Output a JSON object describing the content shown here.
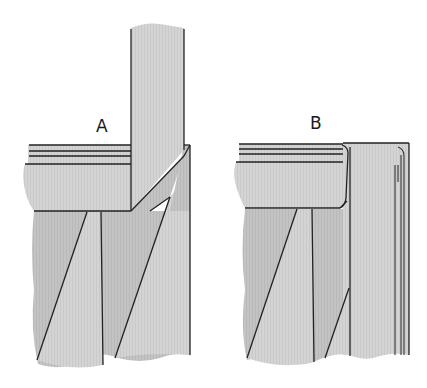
{
  "diagram": {
    "figures": [
      {
        "id": "A",
        "label": "A",
        "description": "Mitered joint: horizontal rail meets vertical upright with diagonal miter cut"
      },
      {
        "id": "B",
        "label": "B",
        "description": "Butt joint: horizontal rail abuts stile with rounded profile and parallel edge lines"
      }
    ],
    "colors": {
      "background": "#ffffff",
      "fill_light": "#d6d6d6",
      "fill_mid": "#c7c7c7",
      "fill_dark": "#bdbdbd",
      "stroke": "#222222"
    }
  }
}
